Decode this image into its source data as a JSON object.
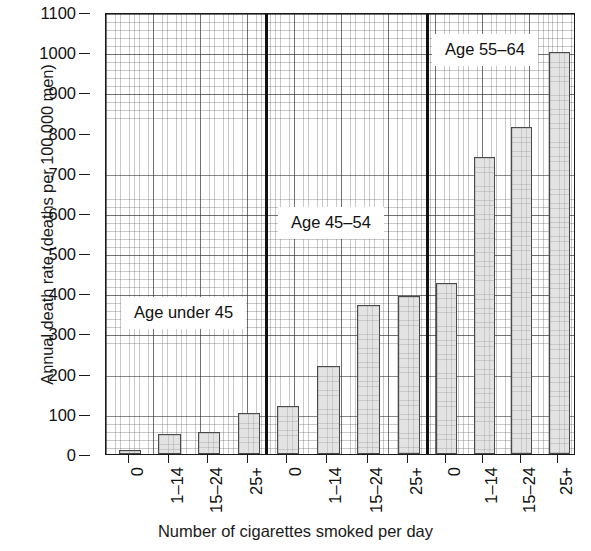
{
  "chart_data": {
    "type": "bar",
    "title": "",
    "xlabel": "Number of cigarettes smoked per day",
    "ylabel": "Annual death rate (deaths per 100 000 men)",
    "ylim": [
      0,
      1100
    ],
    "ytick_step": 100,
    "grid": true,
    "legend_position": "none",
    "categories": [
      "0",
      "1–14",
      "15–24",
      "25+"
    ],
    "groups": [
      {
        "name": "Age under 45",
        "annotation": "Age under 45",
        "categories": [
          "0",
          "1–14",
          "15–24",
          "25+"
        ],
        "values": [
          10,
          50,
          56,
          102
        ]
      },
      {
        "name": "Age 45–54",
        "annotation": "Age 45–54",
        "categories": [
          "0",
          "1–14",
          "15–24",
          "25+"
        ],
        "values": [
          120,
          219,
          370,
          393
        ]
      },
      {
        "name": "Age 55–64",
        "annotation": "Age 55–64",
        "categories": [
          "0",
          "1–14",
          "15–24",
          "25+"
        ],
        "values": [
          425,
          738,
          815,
          1000
        ]
      }
    ],
    "ytick_labels": [
      "1100",
      "1000",
      "900",
      "800",
      "700",
      "600",
      "500",
      "400",
      "300",
      "200",
      "100",
      "0"
    ],
    "ytick_values": [
      1100,
      1000,
      900,
      800,
      700,
      600,
      500,
      400,
      300,
      200,
      100,
      0
    ],
    "bar_fill_color": "#e3e3e3",
    "bar_edge_color": "#4a4a4a",
    "axis_color": "#1a1a1a"
  },
  "axes": {
    "y_title": "Annual death rate (deaths per 100 000 men)",
    "x_title": "Number of cigarettes smoked per day"
  }
}
